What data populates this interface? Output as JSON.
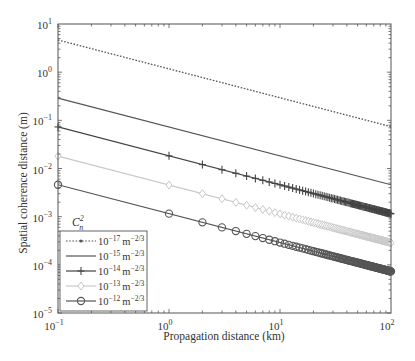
{
  "chart_data": {
    "type": "line",
    "title": "",
    "xlabel": "Propagation distance (km)",
    "ylabel": "Spatial coherence distance (m)",
    "xscale": "log",
    "yscale": "log",
    "xlim": [
      0.1,
      100
    ],
    "ylim": [
      1e-05,
      10
    ],
    "grid": false,
    "x_ticks": [
      {
        "value": 0.1,
        "base": "10",
        "exp": "−1"
      },
      {
        "value": 1,
        "base": "10",
        "exp": "0"
      },
      {
        "value": 10,
        "base": "10",
        "exp": "1"
      },
      {
        "value": 100,
        "base": "10",
        "exp": "2"
      }
    ],
    "y_ticks": [
      {
        "value": 10,
        "base": "10",
        "exp": "1"
      },
      {
        "value": 1,
        "base": "10",
        "exp": "0"
      },
      {
        "value": 0.1,
        "base": "10",
        "exp": "−1"
      },
      {
        "value": 0.01,
        "base": "10",
        "exp": "−2"
      },
      {
        "value": 0.001,
        "base": "10",
        "exp": "−3"
      },
      {
        "value": 0.0001,
        "base": "10",
        "exp": "−4"
      },
      {
        "value": 1e-05,
        "base": "10",
        "exp": "−5"
      }
    ],
    "legend": {
      "title_base": "C",
      "title_sub": "n",
      "title_sup": "2",
      "position": "lower left"
    },
    "power_law_exponent": -0.6,
    "x": [
      0.1,
      1,
      10,
      100
    ],
    "marker_x": "1, 2, 3, ..., 100 km",
    "series": [
      {
        "name": "10^-17 m^-2/3",
        "label_base": "10",
        "label_exp": "−17",
        "unit": "m",
        "unit_exp": "−2/3",
        "values": [
          4.66,
          1.17,
          0.294,
          0.074
        ],
        "style": "dotted",
        "marker": "dot",
        "color": "#555555"
      },
      {
        "name": "10^-15 m^-2/3",
        "label_base": "10",
        "label_exp": "−15",
        "unit": "m",
        "unit_exp": "−2/3",
        "values": [
          0.29,
          0.073,
          0.0183,
          0.0046
        ],
        "style": "solid",
        "marker": "none",
        "color": "#555555"
      },
      {
        "name": "10^-14 m^-2/3",
        "label_base": "10",
        "label_exp": "−14",
        "unit": "m",
        "unit_exp": "−2/3",
        "values": [
          0.073,
          0.0183,
          0.0046,
          0.00115
        ],
        "style": "solid",
        "marker": "plus",
        "color": "#444444"
      },
      {
        "name": "10^-13 m^-2/3",
        "label_base": "10",
        "label_exp": "−13",
        "unit": "m",
        "unit_exp": "−2/3",
        "values": [
          0.018,
          0.0045,
          0.00114,
          0.000287
        ],
        "style": "solid",
        "marker": "diamond",
        "color": "#c8c8c8"
      },
      {
        "name": "10^-12 m^-2/3",
        "label_base": "10",
        "label_exp": "−12",
        "unit": "m",
        "unit_exp": "−2/3",
        "values": [
          0.0046,
          0.00116,
          0.00029,
          7.3e-05
        ],
        "style": "solid",
        "marker": "circle",
        "color": "#555555"
      }
    ]
  }
}
